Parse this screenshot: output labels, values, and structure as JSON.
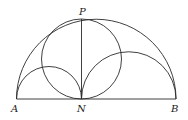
{
  "diagram": {
    "type": "arbelos",
    "labels": {
      "A": "A",
      "N": "N",
      "B": "B",
      "P": "P"
    },
    "points": {
      "A": [
        16.5,
        99
      ],
      "N": [
        81.5,
        99
      ],
      "B": [
        176,
        99
      ],
      "P": [
        81.5,
        19
      ]
    },
    "shapes": [
      {
        "name": "large-semicircle",
        "diameter": "AB"
      },
      {
        "name": "left-semicircle",
        "diameter": "AN"
      },
      {
        "name": "right-semicircle",
        "diameter": "NB"
      },
      {
        "name": "circle-on-PN",
        "diameter": "PN"
      },
      {
        "name": "segment-PN",
        "from": "P",
        "to": "N"
      },
      {
        "name": "baseline-AB",
        "from": "A",
        "to": "B"
      }
    ],
    "colors": {
      "stroke": "#2a2a2a",
      "background": "#ffffff"
    }
  }
}
